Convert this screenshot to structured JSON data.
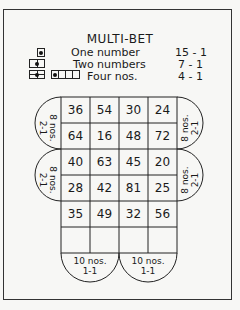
{
  "title": "MULTI-BET",
  "legend": [
    {
      "label": "One number",
      "payout": "15 - 1",
      "icon": "single-square-icon"
    },
    {
      "label": "Two numbers",
      "payout": "7 - 1",
      "icon": "split-square-icon"
    },
    {
      "label": "Four nos.",
      "payout": "4 - 1",
      "icon": "quad-square-icon"
    }
  ],
  "grid": [
    [
      "36",
      "54",
      "30",
      "24"
    ],
    [
      "64",
      "16",
      "48",
      "72"
    ],
    [
      "40",
      "63",
      "45",
      "20"
    ],
    [
      "28",
      "42",
      "81",
      "25"
    ],
    [
      "35",
      "49",
      "32",
      "56"
    ]
  ],
  "side_bets": {
    "left_top": {
      "count": "8 nos.",
      "payout": "2-1"
    },
    "left_bottom": {
      "count": "8 nos.",
      "payout": "2-1"
    },
    "right_top": {
      "count": "8 nos.",
      "payout": "2-1"
    },
    "right_bottom": {
      "count": "8 nos.",
      "payout": "2-1"
    },
    "bottom_left": {
      "count": "10 nos.",
      "payout": "1-1"
    },
    "bottom_right": {
      "count": "10 nos.",
      "payout": "1-1"
    }
  }
}
